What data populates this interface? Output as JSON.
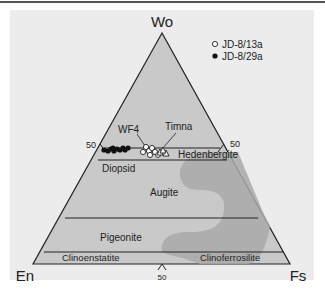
{
  "diagram": {
    "type": "ternary",
    "vertices": {
      "top": "Wo",
      "left": "En",
      "right": "Fs"
    },
    "tick_labels": {
      "left": "50",
      "right": "50",
      "bottom": "50"
    },
    "fields": [
      {
        "name": "Diopsid"
      },
      {
        "name": "Hedenbergite"
      },
      {
        "name": "Augite"
      },
      {
        "name": "Pigeonite"
      },
      {
        "name": "Clinoenstatite"
      },
      {
        "name": "Clinoferrosilite"
      }
    ],
    "annotations": [
      {
        "text": "WF4"
      },
      {
        "text": "Timna"
      }
    ],
    "legend": [
      {
        "symbol": "open-circle",
        "label": "JD-8/13a"
      },
      {
        "symbol": "filled-circle",
        "label": "JD-8/29a"
      }
    ],
    "colors": {
      "panel_bg": "#ececec",
      "triangle_fill": "#c9c9c9",
      "gap_fill": "#a9a9a9",
      "line": "#222222"
    }
  }
}
